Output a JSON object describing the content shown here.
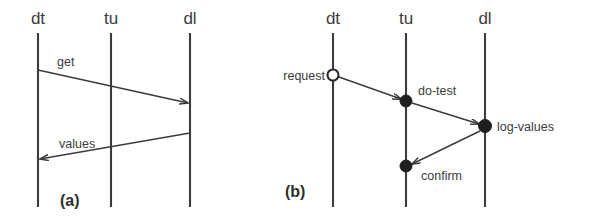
{
  "figure": {
    "background_color": "#ffffff",
    "line_color": "#3c3c3c",
    "text_color": "#3c3c3c",
    "dot_fill_color": "#1f1f1f",
    "dot_open_fill_color": "#ffffff",
    "width": 595,
    "height": 222
  },
  "panels": [
    {
      "id": "a",
      "caption": "(a)",
      "caption_x": 60,
      "caption_y": 206,
      "lifelines": [
        {
          "name": "dt",
          "label": "dt",
          "x": 38,
          "label_x": 38,
          "label_y": 24,
          "top_y": 33,
          "bottom_y": 207
        },
        {
          "name": "tu",
          "label": "tu",
          "x": 111,
          "label_x": 111,
          "label_y": 24,
          "top_y": 33,
          "bottom_y": 207
        },
        {
          "name": "dl",
          "label": "dl",
          "x": 190,
          "label_x": 190,
          "label_y": 24,
          "top_y": 33,
          "bottom_y": 207
        }
      ],
      "messages": [
        {
          "name": "get",
          "label": "get",
          "from": "dt",
          "to": "dl",
          "x1": 38,
          "y1": 70,
          "x2": 188,
          "y2": 103,
          "label_x": 57,
          "label_y": 66,
          "arrowhead": "open",
          "endpoint_marker": "none"
        },
        {
          "name": "values",
          "label": "values",
          "from": "dl",
          "to": "dt",
          "x1": 190,
          "y1": 133,
          "x2": 40,
          "y2": 159,
          "label_x": 59,
          "label_y": 148,
          "arrowhead": "open",
          "endpoint_marker": "none"
        }
      ]
    },
    {
      "id": "b",
      "caption": "(b)",
      "caption_x": 285,
      "caption_y": 197,
      "lifelines": [
        {
          "name": "dt",
          "label": "dt",
          "x": 333,
          "label_x": 333,
          "label_y": 24,
          "top_y": 33,
          "bottom_y": 207
        },
        {
          "name": "tu",
          "label": "tu",
          "x": 406,
          "label_x": 406,
          "label_y": 24,
          "top_y": 33,
          "bottom_y": 207
        },
        {
          "name": "dl",
          "label": "dl",
          "x": 485,
          "label_x": 485,
          "label_y": 24,
          "top_y": 33,
          "bottom_y": 207
        }
      ],
      "events": [
        {
          "name": "request",
          "label": "request",
          "marker": "open-circle",
          "x": 333,
          "y": 75,
          "r": 5.5,
          "label_x": 325,
          "label_y": 80,
          "label_anchor": "end"
        },
        {
          "name": "do-test",
          "label": "do-test",
          "marker": "filled-circle",
          "x": 406,
          "y": 101,
          "r": 6,
          "label_x": 418,
          "label_y": 95,
          "label_anchor": "start"
        },
        {
          "name": "log-values",
          "label": "log-values",
          "marker": "filled-circle",
          "x": 485,
          "y": 126,
          "r": 6.5,
          "label_x": 497,
          "label_y": 131,
          "label_anchor": "start"
        },
        {
          "name": "confirm",
          "label": "confirm",
          "marker": "filled-circle",
          "x": 406,
          "y": 166,
          "r": 6,
          "label_x": 421,
          "label_y": 180,
          "label_anchor": "start"
        }
      ],
      "messages": [
        {
          "name": "request-to-do-test",
          "from": "request",
          "to": "do-test",
          "x1": 339,
          "y1": 77,
          "x2": 401,
          "y2": 99,
          "arrowhead": "open"
        },
        {
          "name": "do-test-to-log-values",
          "from": "do-test",
          "to": "log-values",
          "x1": 412,
          "y1": 103,
          "x2": 479,
          "y2": 124,
          "arrowhead": "open"
        },
        {
          "name": "log-values-to-confirm",
          "from": "log-values",
          "to": "confirm",
          "x1": 480,
          "y1": 131,
          "x2": 412,
          "y2": 164,
          "arrowhead": "open"
        }
      ]
    }
  ]
}
